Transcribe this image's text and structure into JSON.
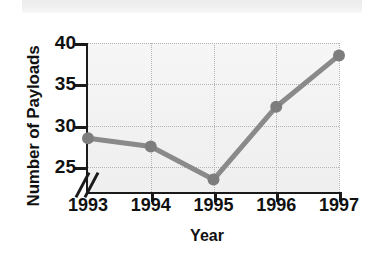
{
  "figure": {
    "scan_band": "scanner-artifact-band"
  },
  "chart_data": {
    "type": "line",
    "title": "",
    "xlabel": "Year",
    "ylabel": "Number of Payloads",
    "categories": [
      "1993",
      "1994",
      "1995",
      "1996",
      "1997"
    ],
    "values": [
      28.5,
      27.5,
      23.5,
      32.3,
      38.5
    ],
    "series": [
      {
        "name": "Number of Payloads",
        "values": [
          28.5,
          27.5,
          23.5,
          32.3,
          38.5
        ]
      }
    ],
    "ylim": [
      22.0,
      40.0
    ],
    "y_ticks": [
      25,
      30,
      35,
      40
    ],
    "y_tick_labels": [
      "25",
      "30",
      "35",
      "40"
    ],
    "y_axis_break": true,
    "y_axis_break_symbol": "//",
    "grid": true,
    "grid_style": "dotted",
    "legend": "none",
    "marker": "circle",
    "colors": {
      "line": "#8a8a8a",
      "marker": "#7d7d7d",
      "axis": "#1a1a1a",
      "grid": "#b4b4b4",
      "plot_background": "#f2f2f2",
      "text": "#111111",
      "figure_background": "#ffffff"
    }
  }
}
